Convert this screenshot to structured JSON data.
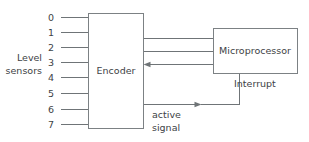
{
  "diagram": {
    "colors": {
      "background": "#ffffff",
      "line": "#6f7477",
      "box_stroke": "#7c8184",
      "text": "#3d4245"
    },
    "sensor_group": {
      "label_line1": "Level",
      "label_line2": "sensors",
      "inputs": [
        {
          "index": "0"
        },
        {
          "index": "1"
        },
        {
          "index": "2"
        },
        {
          "index": "3"
        },
        {
          "index": "4"
        },
        {
          "index": "5"
        },
        {
          "index": "6"
        },
        {
          "index": "7"
        }
      ]
    },
    "blocks": [
      {
        "id": "encoder",
        "label": "Encoder"
      },
      {
        "id": "microprocessor",
        "label": "Microprocessor"
      }
    ],
    "signals": {
      "interrupt_label": "Interrupt",
      "active_signal_line1": "active",
      "active_signal_line2": "signal",
      "data_bus_line_count": "3"
    }
  }
}
